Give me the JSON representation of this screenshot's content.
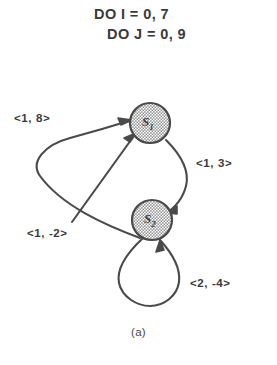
{
  "figure": {
    "caption": "(a)",
    "code_lines": [
      "DO I = 0, 7",
      "DO J = 0, 9"
    ],
    "colors": {
      "ink": "#3a3a3a",
      "edge_stroke": "#4a4a4a",
      "node_stroke": "#4a4a4a",
      "node_fill": "#cfcfcf",
      "background": "#ffffff"
    },
    "nodes": [
      {
        "id": "s1",
        "label": "S",
        "subscript": "1",
        "cx": 150,
        "cy": 123,
        "r": 20
      },
      {
        "id": "s2",
        "label": "S",
        "subscript": "2",
        "cx": 152,
        "cy": 220,
        "r": 20
      }
    ],
    "edges": [
      {
        "id": "edge-a",
        "from": "s2",
        "to": "s1",
        "label": "<1, 8>",
        "shape": "wide-left-loop"
      },
      {
        "id": "edge-b",
        "from": "s1",
        "to": "s2",
        "label": "<1, 3>",
        "shape": "right-arc"
      },
      {
        "id": "edge-c",
        "from": "free",
        "to": "s1",
        "label": "<1, -2>",
        "shape": "straight-diagonal"
      },
      {
        "id": "edge-d",
        "from": "s2",
        "to": "s2",
        "label": "<2, -4>",
        "shape": "self-loop-below"
      }
    ]
  }
}
